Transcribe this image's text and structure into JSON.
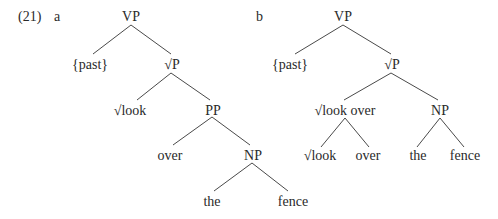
{
  "example": {
    "number": "(21)",
    "sub_a": "a",
    "sub_b": "b"
  },
  "tree_a": {
    "nodes": {
      "vp": "VP",
      "past": "{past}",
      "rootp": "√P",
      "look": "√look",
      "pp": "PP",
      "over": "over",
      "np": "NP",
      "the": "the",
      "fence": "fence"
    }
  },
  "tree_b": {
    "nodes": {
      "vp": "VP",
      "past": "{past}",
      "rootp": "√P",
      "look_over": "√look over",
      "look": "√look",
      "over": "over",
      "np": "NP",
      "the": "the",
      "fence": "fence"
    }
  },
  "colors": {
    "text": "#2a2a2a",
    "edge": "#4a4a4a",
    "background": "#ffffff"
  }
}
